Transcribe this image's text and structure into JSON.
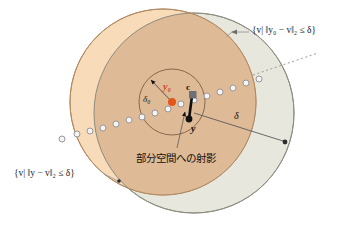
{
  "figure": {
    "background": "#ffffff"
  },
  "colors": {
    "ball_y0_fill": "#f7d9b4",
    "ball_y0_stroke": "#b08a62",
    "ball_y_fill": "#e7e7de",
    "ball_y_stroke": "#8d8d80",
    "overlap_fill": "#dcb894",
    "inner_circle_stroke": "#7d5f44",
    "point_y0": "#e2561b",
    "point_c": "#6f6f78",
    "point_y": "#111111",
    "chain_stroke": "#8d8d93",
    "chain_fill": "#f2f2f2",
    "label_y0": "#d2481a",
    "leader": "#9a9a9a",
    "vector": "#101010"
  },
  "labels": {
    "set_y0": "{v| ‖y₀ − v‖₂ ≤ δ}",
    "set_y": "{v| ‖y − v‖₂ ≤ δ}",
    "projection_caption": "部分空間への射影",
    "point_y0": "y₀",
    "point_c": "c",
    "point_y": "y",
    "radius_inner": "δ₀",
    "radius_outer": "δ"
  },
  "geometry": {
    "ball_y0": {
      "cx": 163,
      "cy": 102,
      "r": 93
    },
    "ball_y": {
      "cx": 194,
      "cy": 113,
      "r": 100
    },
    "inner_ball": {
      "cx": 172,
      "cy": 102,
      "r": 33
    },
    "point_y0": {
      "x": 172,
      "y": 102
    },
    "point_c": {
      "x": 193,
      "y": 95
    },
    "point_y": {
      "x": 189,
      "y": 119
    },
    "subspace_line": {
      "x1": 60,
      "y1": 139,
      "x2": 312,
      "y2": 56
    },
    "radius_arrow": {
      "x1": 194,
      "y1": 113,
      "x2": 287,
      "y2": 143
    }
  }
}
